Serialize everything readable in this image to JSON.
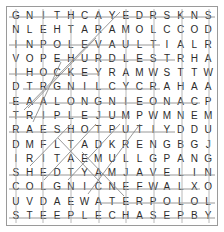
{
  "puzzle": {
    "type": "word-search",
    "rows": 15,
    "cols": 15,
    "grid": [
      [
        "G",
        "N",
        "I",
        "T",
        "H",
        "C",
        "A",
        "Y",
        "E",
        "D",
        "R",
        "S",
        "K",
        "N",
        "S"
      ],
      [
        "N",
        "L",
        "E",
        "H",
        "T",
        "A",
        "R",
        "A",
        "M",
        "O",
        "L",
        "C",
        "C",
        "O",
        "D"
      ],
      [
        "I",
        "N",
        "P",
        "O",
        "L",
        "E",
        "V",
        "A",
        "U",
        "L",
        "T",
        "I",
        "A",
        "L",
        "R"
      ],
      [
        "V",
        "O",
        "P",
        "E",
        "H",
        "U",
        "R",
        "D",
        "L",
        "E",
        "S",
        "T",
        "R",
        "H",
        "A"
      ],
      [
        "I",
        "H",
        "O",
        "C",
        "K",
        "E",
        "Y",
        "R",
        "A",
        "M",
        "W",
        "S",
        "T",
        "T",
        "W"
      ],
      [
        "D",
        "T",
        "R",
        "G",
        "N",
        "I",
        "L",
        "C",
        "Y",
        "C",
        "R",
        "A",
        "H",
        "A",
        "A"
      ],
      [
        "E",
        "A",
        "A",
        "L",
        "O",
        "N",
        "G",
        "N",
        "I",
        "E",
        "O",
        "N",
        "A",
        "C",
        "P"
      ],
      [
        "T",
        "R",
        "I",
        "P",
        "L",
        "E",
        "J",
        "U",
        "M",
        "P",
        "W",
        "M",
        "N",
        "E",
        "M"
      ],
      [
        "R",
        "A",
        "E",
        "S",
        "H",
        "O",
        "T",
        "P",
        "U",
        "T",
        "I",
        "Y",
        "D",
        "D",
        "U"
      ],
      [
        "D",
        "M",
        "F",
        "L",
        "T",
        "A",
        "D",
        "K",
        "R",
        "E",
        "N",
        "G",
        "B",
        "G",
        "J"
      ],
      [
        "I",
        "R",
        "I",
        "T",
        "A",
        "E",
        "M",
        "U",
        "L",
        "L",
        "G",
        "P",
        "A",
        "N",
        "G"
      ],
      [
        "S",
        "H",
        "E",
        "D",
        "T",
        "Y",
        "A",
        "M",
        "J",
        "A",
        "V",
        "E",
        "L",
        "I",
        "N"
      ],
      [
        "C",
        "O",
        "L",
        "G",
        "N",
        "I",
        "C",
        "N",
        "E",
        "F",
        "W",
        "A",
        "L",
        "X",
        "O"
      ],
      [
        "U",
        "V",
        "D",
        "A",
        "E",
        "W",
        "A",
        "T",
        "E",
        "R",
        "P",
        "O",
        "L",
        "O",
        "L"
      ],
      [
        "S",
        "T",
        "E",
        "E",
        "P",
        "L",
        "E",
        "C",
        "H",
        "A",
        "S",
        "E",
        "P",
        "B",
        "Y"
      ]
    ],
    "colors": {
      "letter": "#2b2b2b",
      "border": "#9a9a9a",
      "strike": "#8c8c8c",
      "strike_light": "#b0b0b0",
      "background": "#ffffff"
    }
  }
}
